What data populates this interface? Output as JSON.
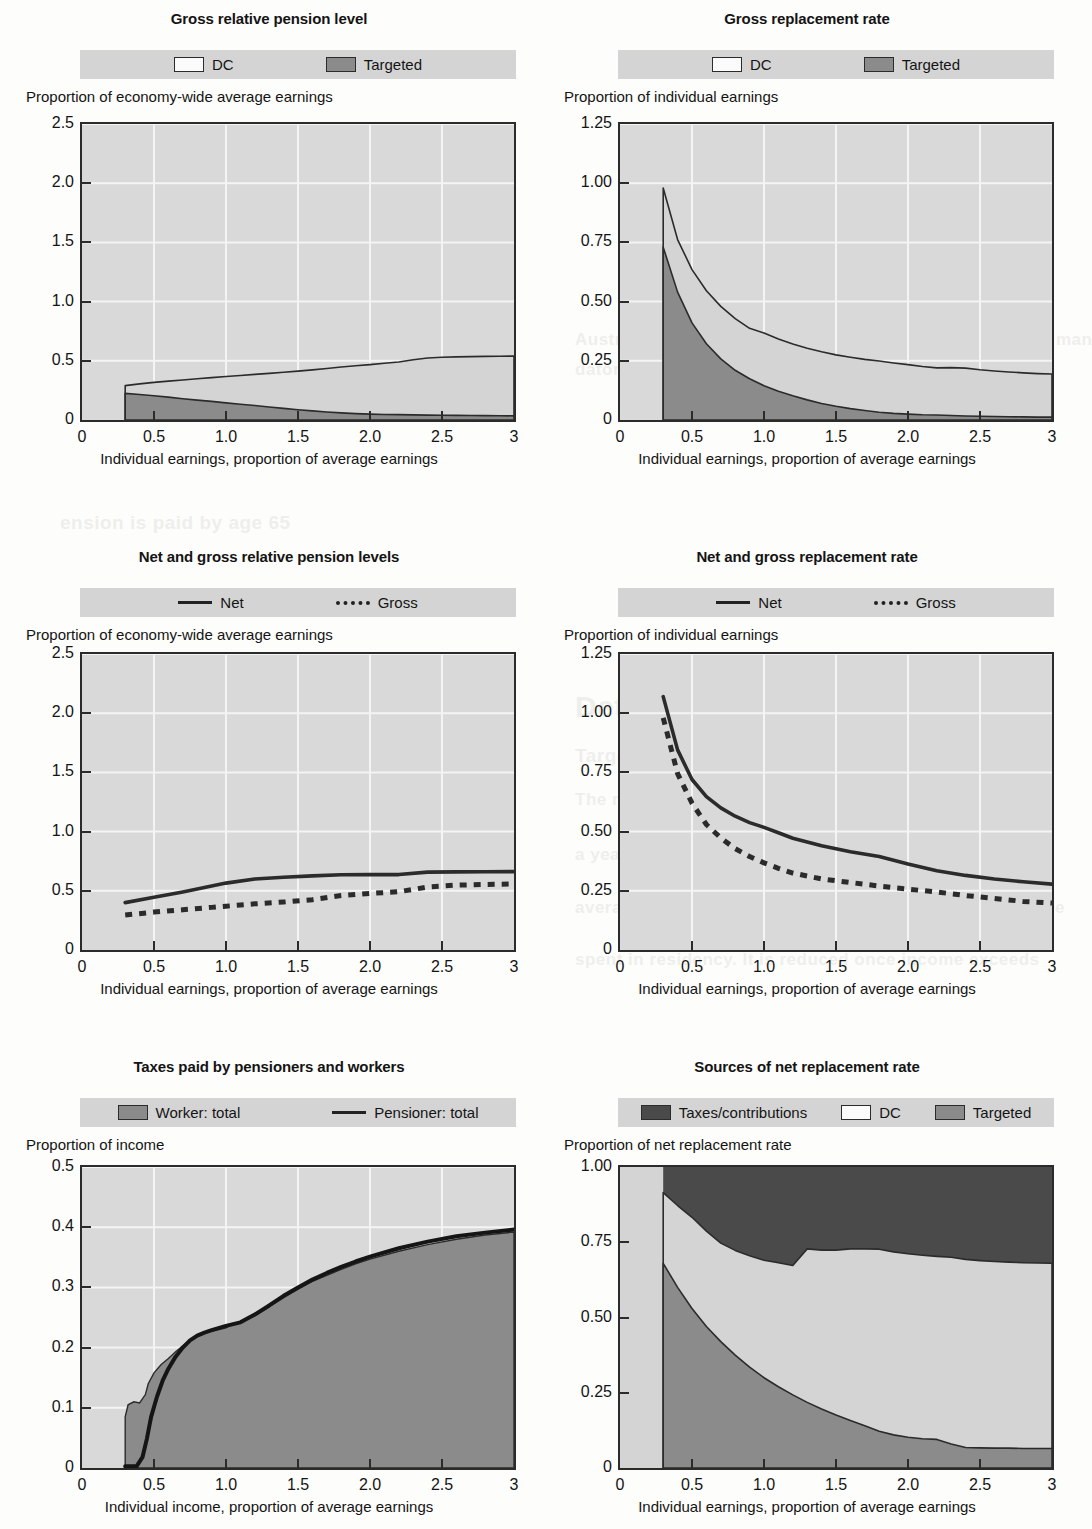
{
  "page": {
    "bleed_texts": [
      {
        "text": "ustralia",
        "x": 700,
        "y": 185,
        "size": 46
      },
      {
        "text": "Australia has a targeted public scheme and a system of man",
        "x": 575,
        "y": 330,
        "size": 17
      },
      {
        "text": "datory private pensions, known as superannuation.",
        "x": 575,
        "y": 360,
        "size": 17
      },
      {
        "text": "ension is paid by age 65",
        "x": 60,
        "y": 512,
        "size": 19
      },
      {
        "text": "Details",
        "x": 575,
        "y": 690,
        "size": 30
      },
      {
        "text": "Targeted scheme",
        "x": 575,
        "y": 745,
        "size": 19
      },
      {
        "text": "The maximum rate of pension for a single person is",
        "x": 575,
        "y": 790,
        "size": 17
      },
      {
        "text": "a year. This is equal to about 25 per cent of the national",
        "x": 575,
        "y": 845,
        "size": 17
      },
      {
        "text": "average earnings. It is proportional to the amount of time",
        "x": 575,
        "y": 898,
        "size": 17
      },
      {
        "text": "spent in residency. It is reduced once income exceeds",
        "x": 575,
        "y": 950,
        "size": 17
      }
    ]
  },
  "charts": [
    {
      "id": "gross-relative-pension-level",
      "title": "Gross relative pension level",
      "ylabel": "Proportion of economy-wide average earnings",
      "xlabel": "Individual earnings, proportion of average earnings",
      "legend": [
        {
          "label": "DC",
          "swatch": "dc-swatch"
        },
        {
          "label": "Targeted",
          "swatch": "targeted-swatch"
        }
      ],
      "yticks": [
        "2.5",
        "2.0",
        "1.5",
        "1.0",
        "0.5",
        "0"
      ],
      "xticks": [
        "0",
        "0.5",
        "1.0",
        "1.5",
        "2.0",
        "2.5",
        "3"
      ]
    },
    {
      "id": "gross-replacement-rate",
      "title": "Gross replacement rate",
      "ylabel": "Proportion of individual earnings",
      "xlabel": "Individual earnings, proportion of average earnings",
      "legend": [
        {
          "label": "DC",
          "swatch": "dc-swatch"
        },
        {
          "label": "Targeted",
          "swatch": "targeted-swatch"
        }
      ],
      "yticks": [
        "1.25",
        "1.00",
        "0.75",
        "0.50",
        "0.25",
        "0"
      ],
      "xticks": [
        "0",
        "0.5",
        "1.0",
        "1.5",
        "2.0",
        "2.5",
        "3"
      ]
    },
    {
      "id": "net-and-gross-relative-pension-levels",
      "title": "Net and gross relative pension levels",
      "ylabel": "Proportion of economy-wide average earnings",
      "xlabel": "Individual earnings, proportion of average earnings",
      "legend": [
        {
          "label": "Net",
          "swatch": "solid-line"
        },
        {
          "label": "Gross",
          "swatch": "dashed-line"
        }
      ],
      "yticks": [
        "2.5",
        "2.0",
        "1.5",
        "1.0",
        "0.5",
        "0"
      ],
      "xticks": [
        "0",
        "0.5",
        "1.0",
        "1.5",
        "2.0",
        "2.5",
        "3"
      ]
    },
    {
      "id": "net-and-gross-replacement-rate",
      "title": "Net and gross replacement rate",
      "ylabel": "Proportion of individual earnings",
      "xlabel": "Individual earnings, proportion of average earnings",
      "legend": [
        {
          "label": "Net",
          "swatch": "solid-line"
        },
        {
          "label": "Gross",
          "swatch": "dashed-line"
        }
      ],
      "yticks": [
        "1.25",
        "1.00",
        "0.75",
        "0.50",
        "0.25",
        "0"
      ],
      "xticks": [
        "0",
        "0.5",
        "1.0",
        "1.5",
        "2.0",
        "2.5",
        "3"
      ]
    },
    {
      "id": "taxes-paid-by-pensioners-and-workers",
      "title": "Taxes paid by pensioners and workers",
      "ylabel": "Proportion of income",
      "xlabel": "Individual income, proportion of average earnings",
      "legend": [
        {
          "label": "Worker: total",
          "swatch": "worker-swatch"
        },
        {
          "label": "Pensioner: total",
          "swatch": "solid-line"
        }
      ],
      "yticks": [
        "0.5",
        "0.4",
        "0.3",
        "0.2",
        "0.1",
        "0"
      ],
      "xticks": [
        "0",
        "0.5",
        "1.0",
        "1.5",
        "2.0",
        "2.5",
        "3"
      ]
    },
    {
      "id": "sources-of-net-replacement-rate",
      "title": "Sources of net replacement rate",
      "ylabel": "Proportion of net replacement rate",
      "xlabel": "Individual earnings, proportion of average earnings",
      "legend": [
        {
          "label": "Taxes/contributions",
          "swatch": "taxes-swatch"
        },
        {
          "label": "DC",
          "swatch": "dc-swatch"
        },
        {
          "label": "Targeted",
          "swatch": "targeted-swatch"
        }
      ],
      "yticks": [
        "1.00",
        "0.75",
        "0.50",
        "0.25",
        "0"
      ],
      "xticks": [
        "0",
        "0.5",
        "1.0",
        "1.5",
        "2.0",
        "2.5",
        "3"
      ]
    }
  ],
  "chart_data": [
    {
      "type": "area",
      "id": "gross-relative-pension-level",
      "title": "Gross relative pension level",
      "xlabel": "Individual earnings, proportion of average earnings",
      "ylabel": "Proportion of economy-wide average earnings",
      "xlim": [
        0,
        3
      ],
      "ylim": [
        0,
        2.5
      ],
      "grid": true,
      "legend_position": "top",
      "stacked": true,
      "x": [
        0.3,
        0.4,
        0.5,
        0.6,
        0.7,
        0.8,
        0.9,
        1.0,
        1.1,
        1.2,
        1.3,
        1.4,
        1.5,
        1.6,
        1.7,
        1.8,
        1.9,
        2.0,
        2.1,
        2.2,
        2.3,
        2.4,
        2.5,
        2.6,
        2.7,
        2.8,
        2.9,
        3.0
      ],
      "series": [
        {
          "name": "Targeted",
          "values": [
            0.225,
            0.215,
            0.205,
            0.193,
            0.18,
            0.168,
            0.157,
            0.145,
            0.133,
            0.122,
            0.11,
            0.098,
            0.087,
            0.077,
            0.068,
            0.06,
            0.054,
            0.05,
            0.047,
            0.045,
            0.043,
            0.041,
            0.04,
            0.039,
            0.038,
            0.037,
            0.036,
            0.035
          ]
        },
        {
          "name": "DC",
          "values": [
            0.065,
            0.09,
            0.113,
            0.135,
            0.158,
            0.18,
            0.201,
            0.222,
            0.243,
            0.263,
            0.284,
            0.305,
            0.326,
            0.346,
            0.367,
            0.388,
            0.404,
            0.418,
            0.432,
            0.445,
            0.466,
            0.483,
            0.49,
            0.494,
            0.497,
            0.5,
            0.503,
            0.505
          ]
        }
      ],
      "totals": [
        0.29,
        0.305,
        0.318,
        0.328,
        0.338,
        0.348,
        0.358,
        0.367,
        0.376,
        0.385,
        0.394,
        0.403,
        0.413,
        0.423,
        0.435,
        0.448,
        0.458,
        0.468,
        0.479,
        0.49,
        0.509,
        0.524,
        0.53,
        0.533,
        0.535,
        0.537,
        0.539,
        0.54
      ]
    },
    {
      "type": "area",
      "id": "gross-replacement-rate",
      "title": "Gross replacement rate",
      "xlabel": "Individual earnings, proportion of average earnings",
      "ylabel": "Proportion of individual earnings",
      "xlim": [
        0,
        3
      ],
      "ylim": [
        0,
        1.25
      ],
      "grid": true,
      "legend_position": "top",
      "stacked": true,
      "x": [
        0.3,
        0.4,
        0.5,
        0.6,
        0.7,
        0.8,
        0.9,
        1.0,
        1.1,
        1.2,
        1.3,
        1.4,
        1.5,
        1.6,
        1.7,
        1.8,
        1.9,
        2.0,
        2.1,
        2.2,
        2.3,
        2.4,
        2.5,
        2.6,
        2.7,
        2.8,
        2.9,
        3.0
      ],
      "series": [
        {
          "name": "Targeted",
          "values": [
            0.73,
            0.54,
            0.41,
            0.322,
            0.258,
            0.21,
            0.174,
            0.145,
            0.121,
            0.102,
            0.085,
            0.07,
            0.058,
            0.048,
            0.04,
            0.033,
            0.028,
            0.025,
            0.022,
            0.021,
            0.019,
            0.017,
            0.016,
            0.015,
            0.014,
            0.013,
            0.012,
            0.012
          ]
        },
        {
          "name": "DC",
          "values": [
            0.25,
            0.222,
            0.225,
            0.224,
            0.222,
            0.218,
            0.213,
            0.222,
            0.221,
            0.219,
            0.218,
            0.218,
            0.217,
            0.217,
            0.216,
            0.216,
            0.213,
            0.209,
            0.204,
            0.199,
            0.202,
            0.202,
            0.196,
            0.192,
            0.189,
            0.186,
            0.184,
            0.182
          ]
        }
      ],
      "totals": [
        0.98,
        0.762,
        0.635,
        0.546,
        0.48,
        0.428,
        0.387,
        0.367,
        0.342,
        0.321,
        0.303,
        0.288,
        0.275,
        0.265,
        0.256,
        0.249,
        0.241,
        0.234,
        0.226,
        0.22,
        0.221,
        0.219,
        0.212,
        0.207,
        0.203,
        0.199,
        0.196,
        0.194
      ]
    },
    {
      "type": "line",
      "id": "net-and-gross-relative-pension-levels",
      "title": "Net and gross relative pension levels",
      "xlabel": "Individual earnings, proportion of average earnings",
      "ylabel": "Proportion of economy-wide average earnings",
      "xlim": [
        0,
        3
      ],
      "ylim": [
        0,
        2.5
      ],
      "grid": true,
      "legend_position": "top",
      "x": [
        0.3,
        0.5,
        0.7,
        0.9,
        1.0,
        1.2,
        1.4,
        1.6,
        1.8,
        2.0,
        2.2,
        2.4,
        2.6,
        2.8,
        3.0
      ],
      "series": [
        {
          "name": "Net",
          "style": "solid",
          "values": [
            0.4,
            0.445,
            0.49,
            0.54,
            0.565,
            0.6,
            0.615,
            0.626,
            0.635,
            0.637,
            0.637,
            0.658,
            0.66,
            0.661,
            0.662
          ]
        },
        {
          "name": "Gross",
          "style": "dashed",
          "values": [
            0.295,
            0.32,
            0.34,
            0.36,
            0.37,
            0.39,
            0.405,
            0.425,
            0.46,
            0.478,
            0.492,
            0.532,
            0.548,
            0.553,
            0.558
          ]
        }
      ]
    },
    {
      "type": "line",
      "id": "net-and-gross-replacement-rate",
      "title": "Net and gross replacement rate",
      "xlabel": "Individual earnings, proportion of average earnings",
      "ylabel": "Proportion of individual earnings",
      "xlim": [
        0,
        3
      ],
      "ylim": [
        0,
        1.25
      ],
      "grid": true,
      "legend_position": "top",
      "x": [
        0.3,
        0.4,
        0.5,
        0.6,
        0.7,
        0.8,
        0.9,
        1.0,
        1.1,
        1.2,
        1.4,
        1.6,
        1.8,
        2.0,
        2.2,
        2.4,
        2.6,
        2.8,
        3.0
      ],
      "series": [
        {
          "name": "Net",
          "style": "solid",
          "values": [
            1.07,
            0.845,
            0.72,
            0.648,
            0.6,
            0.565,
            0.538,
            0.518,
            0.495,
            0.472,
            0.44,
            0.415,
            0.395,
            0.363,
            0.335,
            0.315,
            0.3,
            0.288,
            0.278
          ]
        },
        {
          "name": "Gross",
          "style": "dashed",
          "values": [
            0.98,
            0.745,
            0.62,
            0.53,
            0.473,
            0.428,
            0.395,
            0.368,
            0.345,
            0.325,
            0.3,
            0.285,
            0.27,
            0.257,
            0.245,
            0.23,
            0.218,
            0.205,
            0.198
          ]
        }
      ]
    },
    {
      "type": "area",
      "id": "taxes-paid-by-pensioners-and-workers",
      "title": "Taxes paid by pensioners and workers",
      "xlabel": "Individual income, proportion of average earnings",
      "ylabel": "Proportion of income",
      "xlim": [
        0,
        3
      ],
      "ylim": [
        0,
        0.5
      ],
      "grid": true,
      "legend_position": "top",
      "series": [
        {
          "name": "Worker: total",
          "style": "area",
          "x": [
            0.3,
            0.32,
            0.36,
            0.4,
            0.44,
            0.46,
            0.5,
            0.55,
            0.6,
            0.65,
            0.7,
            0.75,
            0.8,
            0.85,
            0.9,
            1.0,
            1.05,
            1.1,
            1.2,
            1.3,
            1.4,
            1.5,
            1.6,
            1.7,
            1.8,
            1.9,
            2.0,
            2.2,
            2.4,
            2.6,
            2.8,
            3.0
          ],
          "values": [
            0.085,
            0.105,
            0.11,
            0.108,
            0.122,
            0.14,
            0.158,
            0.172,
            0.182,
            0.193,
            0.203,
            0.212,
            0.22,
            0.224,
            0.227,
            0.233,
            0.24,
            0.243,
            0.253,
            0.268,
            0.283,
            0.297,
            0.31,
            0.32,
            0.33,
            0.339,
            0.347,
            0.36,
            0.371,
            0.38,
            0.387,
            0.392
          ]
        },
        {
          "name": "Pensioner: total",
          "style": "solid",
          "x": [
            0.3,
            0.38,
            0.42,
            0.45,
            0.48,
            0.52,
            0.56,
            0.6,
            0.65,
            0.7,
            0.75,
            0.8,
            0.85,
            0.9,
            1.0,
            1.1,
            1.2,
            1.3,
            1.4,
            1.5,
            1.6,
            1.7,
            1.8,
            1.9,
            2.0,
            2.2,
            2.4,
            2.6,
            2.8,
            3.0
          ],
          "values": [
            0.003,
            0.003,
            0.018,
            0.048,
            0.085,
            0.118,
            0.145,
            0.165,
            0.185,
            0.2,
            0.212,
            0.22,
            0.225,
            0.229,
            0.236,
            0.242,
            0.255,
            0.27,
            0.286,
            0.3,
            0.313,
            0.324,
            0.334,
            0.343,
            0.351,
            0.365,
            0.376,
            0.385,
            0.391,
            0.396
          ]
        }
      ]
    },
    {
      "type": "area",
      "id": "sources-of-net-replacement-rate",
      "title": "Sources of net replacement rate",
      "xlabel": "Individual earnings, proportion of average earnings",
      "ylabel": "Proportion of net replacement rate",
      "xlim": [
        0,
        3
      ],
      "ylim": [
        0,
        1.0
      ],
      "grid": true,
      "legend_position": "top",
      "stacked": true,
      "x": [
        0.3,
        0.4,
        0.5,
        0.6,
        0.7,
        0.8,
        0.9,
        1.0,
        1.1,
        1.2,
        1.3,
        1.4,
        1.5,
        1.6,
        1.7,
        1.8,
        1.9,
        2.0,
        2.1,
        2.2,
        2.3,
        2.4,
        2.5,
        2.6,
        2.7,
        2.8,
        2.9,
        3.0
      ],
      "series": [
        {
          "name": "Targeted",
          "values": [
            0.68,
            0.6,
            0.53,
            0.47,
            0.42,
            0.375,
            0.335,
            0.3,
            0.27,
            0.243,
            0.218,
            0.196,
            0.176,
            0.158,
            0.14,
            0.122,
            0.11,
            0.102,
            0.097,
            0.095,
            0.08,
            0.068,
            0.067,
            0.066,
            0.066,
            0.065,
            0.065,
            0.065
          ]
        },
        {
          "name": "DC",
          "values": [
            0.235,
            0.272,
            0.303,
            0.317,
            0.327,
            0.348,
            0.37,
            0.39,
            0.412,
            0.43,
            0.51,
            0.528,
            0.548,
            0.57,
            0.588,
            0.605,
            0.608,
            0.61,
            0.61,
            0.608,
            0.62,
            0.625,
            0.622,
            0.62,
            0.618,
            0.617,
            0.616,
            0.615
          ]
        }
      ],
      "totals": [
        0.915,
        0.872,
        0.833,
        0.787,
        0.747,
        0.723,
        0.705,
        0.69,
        0.682,
        0.673,
        0.728,
        0.724,
        0.724,
        0.728,
        0.728,
        0.727,
        0.718,
        0.712,
        0.707,
        0.703,
        0.7,
        0.693,
        0.689,
        0.686,
        0.684,
        0.682,
        0.681,
        0.68
      ]
    }
  ]
}
